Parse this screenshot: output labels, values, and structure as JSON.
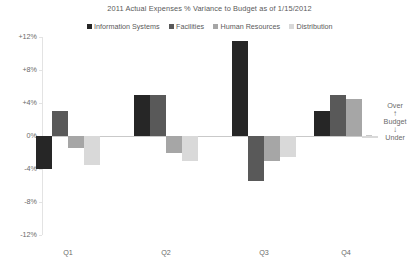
{
  "chart": {
    "title": "2011 Actual Expenses % Variance to Budget as of 1/15/2012"
  },
  "legend": {
    "position": "top-center",
    "items": [
      {
        "label": "Information Systems",
        "color": "#262626",
        "swatch_icon": "square-marker-icon"
      },
      {
        "label": "Facilities",
        "color": "#595959",
        "swatch_icon": "square-marker-icon"
      },
      {
        "label": "Human Resources",
        "color": "#a6a6a6",
        "swatch_icon": "square-marker-icon"
      },
      {
        "label": "Distribution",
        "color": "#d9d9d9",
        "swatch_icon": "square-marker-icon"
      }
    ]
  },
  "annotation": {
    "over_label": "Over",
    "up_arrow": "↑",
    "budget_label": "Budget",
    "down_arrow": "↓",
    "under_label": "Under"
  },
  "axis": {
    "y_ticks": [
      "+12%",
      "+8%",
      "+4%",
      "0%",
      "-4%",
      "-8%",
      "-12%"
    ],
    "y_tick_values": [
      12,
      8,
      4,
      0,
      -4,
      -8,
      -12
    ],
    "x_ticks": [
      "Q1",
      "Q2",
      "Q3",
      "Q4"
    ]
  },
  "chart_data": {
    "type": "bar",
    "title": "2011 Actual Expenses % Variance to Budget as of 1/15/2012",
    "xlabel": "",
    "ylabel": "",
    "ylim": [
      -12,
      12
    ],
    "ytick_step": 4,
    "ytick_labels": [
      "+12%",
      "+8%",
      "+4%",
      "0%",
      "-4%",
      "-8%",
      "-12%"
    ],
    "grid": false,
    "zero_line": true,
    "legend_position": "top-center",
    "categories": [
      "Q1",
      "Q2",
      "Q3",
      "Q4"
    ],
    "series": [
      {
        "name": "Information Systems",
        "color": "#262626",
        "values": [
          -4.0,
          5.0,
          11.5,
          3.0
        ]
      },
      {
        "name": "Facilities",
        "color": "#595959",
        "values": [
          3.0,
          5.0,
          -5.5,
          5.0
        ]
      },
      {
        "name": "Human Resources",
        "color": "#a6a6a6",
        "values": [
          -1.5,
          -2.0,
          -3.0,
          4.5
        ]
      },
      {
        "name": "Distribution",
        "color": "#d9d9d9",
        "values": [
          -3.5,
          -3.0,
          -2.5,
          -0.2
        ]
      }
    ],
    "annotations": [
      {
        "text": "Over",
        "position": "right-above-zero"
      },
      {
        "text": "Budget",
        "position": "right-at-zero"
      },
      {
        "text": "Under",
        "position": "right-below-zero"
      }
    ]
  }
}
